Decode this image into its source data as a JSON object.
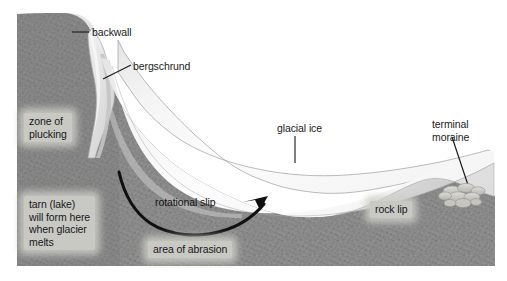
{
  "figure": {
    "canvas": {
      "width": 507,
      "height": 281
    },
    "background_color": "#ffffff"
  },
  "colors": {
    "bedrock": "#8b8b8b",
    "bedrock_dark": "#7c7c7c",
    "ice_light": "#fbfbfb",
    "ice_mid": "#ededed",
    "ice_shadow": "#d9d9d9",
    "ice_outline": "#9b9b9b",
    "arrow": "#121212",
    "leader": "#1a1a1a",
    "label_text": "#1b1b1b",
    "label_halo": "#c9c9c4",
    "moraine": "#cfcfca"
  },
  "labels": {
    "backwall": "backwall",
    "bergschrund": "bergschrund",
    "zone_of_plucking": "zone of\nplucking",
    "tarn": "tarn (lake)\nwill form here\nwhen glacier\nmelts",
    "rotational_slip": "rotational slip",
    "area_of_abrasion": "area of abrasion",
    "glacial_ice": "glacial ice",
    "rock_lip": "rock lip",
    "terminal_moraine": "terminal\nmoraine"
  },
  "leaders": {
    "backwall": {
      "type": "horizontal",
      "from": [
        72,
        32
      ],
      "to": [
        89,
        32
      ]
    },
    "bergschrund": {
      "type": "diagonal",
      "from": [
        103,
        79
      ],
      "to": [
        131,
        65
      ]
    },
    "glacial_ice": {
      "type": "vertical",
      "from": [
        295,
        136
      ],
      "to": [
        295,
        163
      ]
    },
    "terminal_moraine": {
      "type": "diagonal",
      "from": [
        452,
        137
      ],
      "to": [
        470,
        191
      ]
    }
  },
  "features": {
    "rotational_slip_arrow": {
      "description": "curved arrow showing rotational slip of ice in the corrie basin",
      "start": [
        119,
        172
      ],
      "end": [
        266,
        197
      ],
      "arrowhead": true
    },
    "terminal_moraine_cluster": {
      "description": "cluster of rounded boulders deposited at the glacier snout",
      "center": [
        462,
        192
      ],
      "boulder_count": 9
    },
    "bergschrund_crevasse": {
      "description": "deep crevasse separating ice from the backwall near the top of the glacier",
      "apex": [
        104,
        45
      ]
    }
  }
}
